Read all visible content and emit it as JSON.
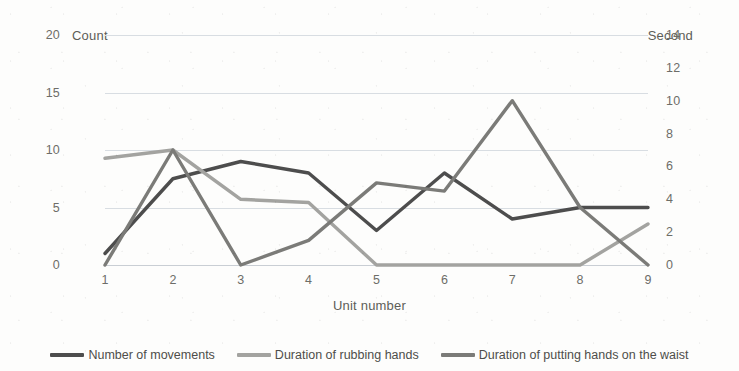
{
  "chart_data": {
    "type": "line",
    "title": "",
    "xlabel": "Unit number",
    "ylabel_left": "Count",
    "ylabel_right": "Second",
    "x": [
      1,
      2,
      3,
      4,
      5,
      6,
      7,
      8,
      9
    ],
    "xtick_labels": [
      "1",
      "2",
      "3",
      "4",
      "5",
      "6",
      "7",
      "8",
      "9"
    ],
    "ylim_left": [
      0,
      20
    ],
    "ytick_labels_left": [
      "0",
      "5",
      "10",
      "15",
      "20"
    ],
    "ytick_values_left": [
      0,
      5,
      10,
      15,
      20
    ],
    "ylim_right": [
      0,
      14
    ],
    "ytick_labels_right": [
      "0",
      "2",
      "4",
      "6",
      "8",
      "10",
      "12",
      "14"
    ],
    "ytick_values_right": [
      0,
      2,
      4,
      6,
      8,
      10,
      12,
      14
    ],
    "grid": true,
    "legend_position": "bottom",
    "series": [
      {
        "name": "Number of movements",
        "axis": "left",
        "color": "#4d4d4d",
        "values": [
          1,
          7.5,
          9,
          8,
          3,
          8,
          4,
          5,
          5
        ]
      },
      {
        "name": "Duration of rubbing hands",
        "axis": "right",
        "color": "#a3a3a0",
        "values": [
          6.5,
          7,
          4,
          3.8,
          0,
          0,
          0,
          0,
          2.5
        ]
      },
      {
        "name": "Duration of putting hands on the waist",
        "axis": "right",
        "color": "#7b7b78",
        "values": [
          0,
          7,
          0,
          1.5,
          5,
          4.5,
          10,
          3.5,
          0
        ]
      }
    ]
  }
}
